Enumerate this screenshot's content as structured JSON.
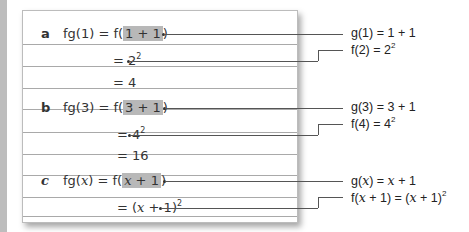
{
  "parts": [
    {
      "letter": "a",
      "line1": {
        "lhs": "fg(1) = f(",
        "highlight": "1 + 1",
        "rhs": ")"
      },
      "line2": {
        "pre": "= 2",
        "sup": "2"
      },
      "line3": "= 4",
      "annotation1": "g(1) = 1 + 1",
      "annotation2": {
        "pre": "f(2) = 2",
        "sup": "2"
      }
    },
    {
      "letter": "b",
      "line1": {
        "lhs": "fg(3) = f(",
        "highlight": "3 + 1",
        "rhs": ")"
      },
      "line2": {
        "pre": "= 4",
        "sup": "2"
      },
      "line3": "= 16",
      "annotation1": "g(3) = 3 + 1",
      "annotation2": {
        "pre": "f(4) = 4",
        "sup": "2"
      }
    },
    {
      "letter": "c",
      "line1": {
        "lhs_a": "fg(",
        "var": "x",
        "lhs_b": ") = f(",
        "highlight_var": "x",
        "highlight_rest": " + 1",
        "rhs": ")"
      },
      "line2": {
        "pre": "= (",
        "var": "x",
        "post": " + 1)",
        "sup": "2"
      },
      "annotation1": {
        "a": "g(",
        "var": "x",
        "b": ") = ",
        "var2": "x",
        "c": " + 1"
      },
      "annotation2": {
        "a": "f(",
        "var": "x",
        "b": " + 1) = (",
        "var2": "x",
        "c": " + 1)",
        "sup": "2"
      }
    }
  ],
  "colors": {
    "highlight": "#b8b8b8",
    "rule": "#a9a9a9",
    "leader": "#555555",
    "strip": "#bdbdbd"
  }
}
